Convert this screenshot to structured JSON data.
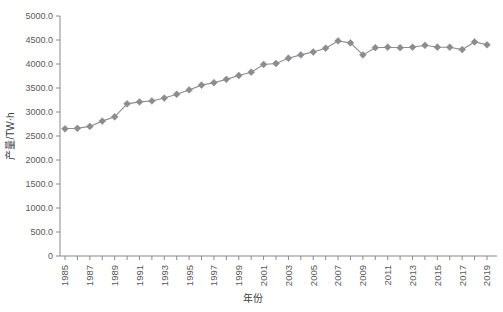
{
  "chart_data": {
    "type": "line",
    "title": "",
    "subtitle": "",
    "xlabel": "年份",
    "ylabel": "产量/TW·h",
    "xlim": [
      1985,
      2019
    ],
    "ylim": [
      0,
      5000
    ],
    "grid": false,
    "legend": null,
    "marker": "diamond",
    "series_color": "#8c8c8e",
    "x": [
      1985,
      1986,
      1987,
      1988,
      1989,
      1990,
      1991,
      1992,
      1993,
      1994,
      1995,
      1996,
      1997,
      1998,
      1999,
      2000,
      2001,
      2002,
      2003,
      2004,
      2005,
      2006,
      2007,
      2008,
      2009,
      2010,
      2011,
      2012,
      2013,
      2014,
      2015,
      2016,
      2017,
      2018,
      2019
    ],
    "values": [
      2650,
      2660,
      2700,
      2810,
      2900,
      3170,
      3210,
      3230,
      3290,
      3370,
      3460,
      3560,
      3610,
      3680,
      3760,
      3830,
      3990,
      4010,
      4120,
      4190,
      4250,
      4330,
      4480,
      4440,
      4190,
      4340,
      4350,
      4340,
      4350,
      4390,
      4350,
      4350,
      4300,
      4460,
      4400
    ],
    "series": [
      {
        "name": "产量",
        "values": [
          2650,
          2660,
          2700,
          2810,
          2900,
          3170,
          3210,
          3230,
          3290,
          3370,
          3460,
          3560,
          3610,
          3680,
          3760,
          3830,
          3990,
          4010,
          4120,
          4190,
          4250,
          4330,
          4480,
          4440,
          4190,
          4340,
          4350,
          4340,
          4350,
          4390,
          4350,
          4350,
          4300,
          4460,
          4400
        ]
      }
    ],
    "ytick_labels": [
      "5000.0",
      "4500.0",
      "4000.0",
      "3500.0",
      "3000.0",
      "2500.0",
      "2000.0",
      "1500.0",
      "1000.0",
      "500.0",
      "0"
    ],
    "ytick_values": [
      5000,
      4500,
      4000,
      3500,
      3000,
      2500,
      2000,
      1500,
      1000,
      500,
      0
    ],
    "xtick_labels": [
      "1985",
      "1987",
      "1989",
      "1991",
      "1993",
      "1995",
      "1997",
      "1999",
      "2001",
      "2003",
      "2005",
      "2007",
      "2009",
      "2011",
      "2013",
      "2015",
      "2017",
      "2019"
    ],
    "xtick_values": [
      1985,
      1987,
      1989,
      1991,
      1993,
      1995,
      1997,
      1999,
      2001,
      2003,
      2005,
      2007,
      2009,
      2011,
      2013,
      2015,
      2017,
      2019
    ],
    "axis_color": "#8a8a8c",
    "text_color": "#59595b"
  }
}
